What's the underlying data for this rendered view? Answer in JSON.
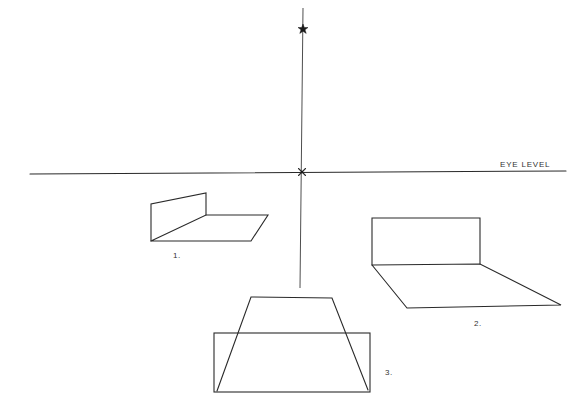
{
  "diagram": {
    "title": "",
    "stroke_color": "#2a2a2a",
    "background": "#ffffff",
    "horizon": {
      "label": "EYE LEVEL",
      "x1": 30,
      "y1": 174,
      "x2": 566,
      "y2": 171
    },
    "vertical_axis": {
      "x1": 303,
      "y1": 8,
      "x2": 300,
      "y2": 288
    },
    "points": [
      {
        "name": "upper-vanishing-point",
        "x": 303,
        "y": 29,
        "marker": "star"
      },
      {
        "name": "center-vanishing-point",
        "x": 302,
        "y": 172,
        "marker": "cross"
      }
    ],
    "figures": [
      {
        "label": "1.",
        "label_pos": {
          "x": 173,
          "y": 252
        },
        "description": "Vertical wall with floor plane receding to the right",
        "wall": [
          [
            151,
            241
          ],
          [
            151,
            204
          ],
          [
            206,
            193
          ],
          [
            206,
            215
          ]
        ],
        "floor": [
          [
            151,
            241
          ],
          [
            206,
            215
          ],
          [
            268,
            215
          ],
          [
            251,
            241
          ],
          [
            151,
            241
          ]
        ]
      },
      {
        "label": "2.",
        "label_pos": {
          "x": 474,
          "y": 320
        },
        "description": "Frontal wall with floor plane projecting toward viewer",
        "wall": [
          [
            372,
            265
          ],
          [
            372,
            218
          ],
          [
            480,
            218
          ],
          [
            480,
            264
          ]
        ],
        "floor": [
          [
            372,
            265
          ],
          [
            480,
            264
          ],
          [
            561,
            305
          ],
          [
            407,
            308
          ],
          [
            372,
            265
          ]
        ]
      },
      {
        "label": "3.",
        "label_pos": {
          "x": 385,
          "y": 369
        },
        "description": "Rectangle overlapped by a receding trapezoid plane",
        "rectangle": {
          "x1": 214,
          "y1": 333,
          "x2": 370,
          "y2": 392
        },
        "trapezoid": [
          [
            217,
            391
          ],
          [
            251,
            297
          ],
          [
            332,
            298
          ],
          [
            368,
            390
          ]
        ]
      }
    ]
  }
}
